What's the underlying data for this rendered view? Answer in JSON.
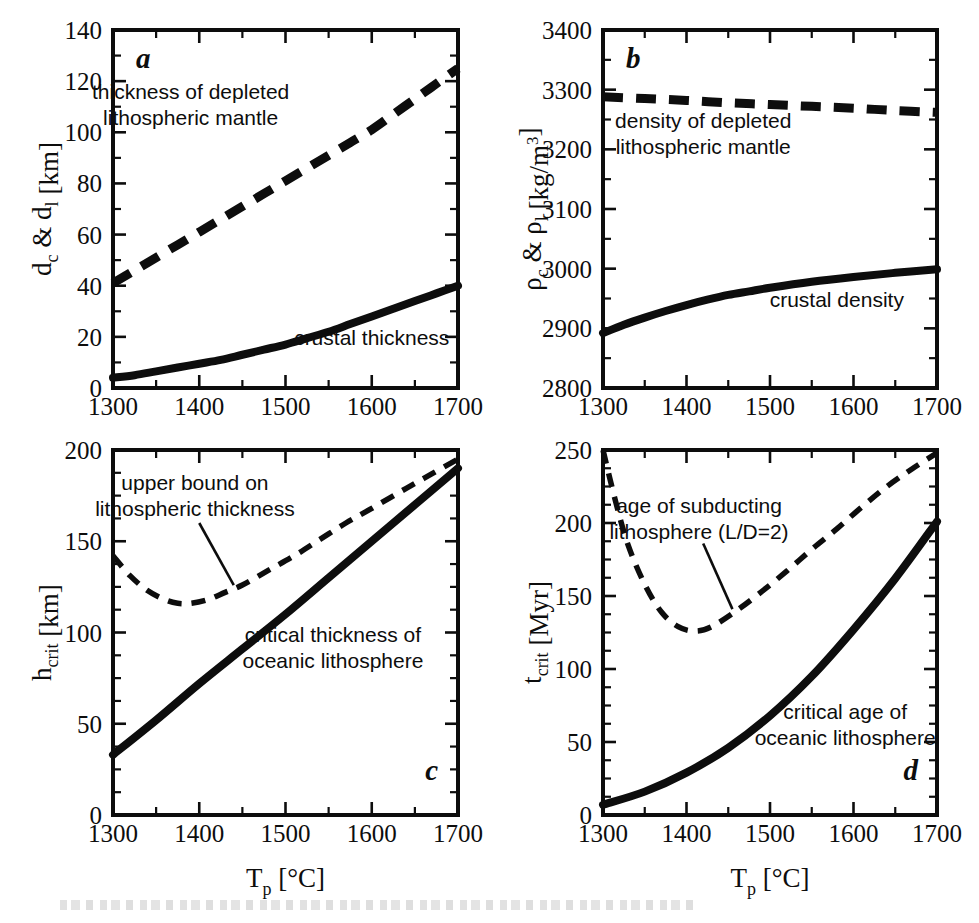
{
  "figure": {
    "title": "",
    "panels": [
      "a",
      "b",
      "c",
      "d"
    ],
    "shared_xlabel": "T_p [°C]",
    "xlabel_parts": {
      "base": "T",
      "sub": "p",
      "unit": "[°C]"
    }
  },
  "chart_data": [
    {
      "id": "panel-a",
      "type": "line",
      "panel_letter": "a",
      "title": "",
      "xlabel": "T_p [°C]",
      "ylabel": "d_c & d_l [km]",
      "ylabel_parts": {
        "p1": "d",
        "s1": "c",
        "amp": " & ",
        "p2": "d",
        "s2": "l",
        "unit": " [km]"
      },
      "xlim": [
        1300,
        1700
      ],
      "ylim": [
        0,
        140
      ],
      "xticks": [
        1300,
        1400,
        1500,
        1600,
        1700
      ],
      "yticks": [
        0,
        20,
        40,
        60,
        80,
        100,
        120,
        140
      ],
      "x_minor_step": 50,
      "y_minor_step": 10,
      "grid": false,
      "legend": "inline-annotations",
      "series": [
        {
          "name": "thickness of depleted lithospheric mantle",
          "style": "dashed-thick",
          "x": [
            1300,
            1325,
            1350,
            1375,
            1400,
            1425,
            1450,
            1475,
            1500,
            1525,
            1550,
            1575,
            1600,
            1625,
            1650,
            1675,
            1700
          ],
          "values": [
            41,
            46,
            51,
            56,
            61,
            66,
            71,
            76,
            81,
            86,
            91,
            96,
            101,
            107,
            113,
            119,
            125
          ]
        },
        {
          "name": "crustal thickness",
          "style": "solid-thick",
          "x": [
            1300,
            1325,
            1350,
            1375,
            1400,
            1425,
            1450,
            1475,
            1500,
            1525,
            1550,
            1575,
            1600,
            1625,
            1650,
            1675,
            1700
          ],
          "values": [
            4,
            5,
            6.5,
            8,
            9.5,
            11,
            13,
            15,
            17,
            19.5,
            22,
            25,
            28,
            31,
            34,
            37,
            40
          ]
        }
      ],
      "annotations": [
        {
          "text_lines": [
            "thickness of depleted",
            "lithospheric mantle"
          ],
          "x": 1390,
          "y": 113
        },
        {
          "text_lines": [
            "crustal thickness"
          ],
          "x": 1600,
          "y": 17
        }
      ]
    },
    {
      "id": "panel-b",
      "type": "line",
      "panel_letter": "b",
      "title": "",
      "xlabel": "T_p [°C]",
      "ylabel": "ρ_c & ρ_l [kg/m³]",
      "ylabel_parts": {
        "p1": "ρ",
        "s1": "c",
        "amp": " & ",
        "p2": "ρ",
        "s2": "l",
        "unit": " [kg/m",
        "sup": "3",
        "close": "]"
      },
      "xlim": [
        1300,
        1700
      ],
      "ylim": [
        2800,
        3400
      ],
      "xticks": [
        1300,
        1400,
        1500,
        1600,
        1700
      ],
      "yticks": [
        2800,
        2900,
        3000,
        3100,
        3200,
        3300,
        3400
      ],
      "x_minor_step": 50,
      "y_minor_step": 50,
      "grid": false,
      "legend": "inline-annotations",
      "series": [
        {
          "name": "density of depleted lithospheric mantle",
          "style": "dashed-thick",
          "x": [
            1300,
            1350,
            1400,
            1450,
            1500,
            1550,
            1600,
            1650,
            1700
          ],
          "values": [
            3288,
            3285,
            3282,
            3278,
            3275,
            3272,
            3269,
            3265,
            3262
          ]
        },
        {
          "name": "crustal density",
          "style": "solid-thick",
          "x": [
            1300,
            1325,
            1350,
            1375,
            1400,
            1425,
            1450,
            1475,
            1500,
            1550,
            1600,
            1650,
            1700
          ],
          "values": [
            2892,
            2906,
            2918,
            2929,
            2939,
            2948,
            2956,
            2962,
            2968,
            2978,
            2986,
            2993,
            2999
          ]
        }
      ],
      "annotations": [
        {
          "text_lines": [
            "density of depleted",
            "lithospheric mantle"
          ],
          "x": 1420,
          "y": 3235
        },
        {
          "text_lines": [
            "crustal density"
          ],
          "x": 1580,
          "y": 2935
        }
      ]
    },
    {
      "id": "panel-c",
      "type": "line",
      "panel_letter": "c",
      "title": "",
      "xlabel": "T_p [°C]",
      "ylabel": "h_crit [km]",
      "ylabel_parts": {
        "p1": "h",
        "s1": "crit",
        "unit": " [km]"
      },
      "xlim": [
        1300,
        1700
      ],
      "ylim": [
        0,
        200
      ],
      "xticks": [
        1300,
        1400,
        1500,
        1600,
        1700
      ],
      "yticks": [
        0,
        50,
        100,
        150,
        200
      ],
      "x_minor_step": 50,
      "y_minor_step": 12.5,
      "grid": false,
      "legend": "inline-annotations",
      "series": [
        {
          "name": "upper bound on lithospheric thickness",
          "style": "dashed-thin",
          "x": [
            1300,
            1320,
            1340,
            1360,
            1375,
            1390,
            1410,
            1430,
            1450,
            1480,
            1510,
            1540,
            1570,
            1600,
            1640,
            1670,
            1700
          ],
          "values": [
            142,
            131,
            123,
            118,
            116,
            116,
            118,
            122,
            126,
            134,
            142,
            151,
            160,
            168,
            179,
            187,
            195
          ]
        },
        {
          "name": "critical thickness of oceanic lithosphere",
          "style": "solid-thick",
          "x": [
            1300,
            1350,
            1400,
            1450,
            1500,
            1550,
            1600,
            1650,
            1700
          ],
          "values": [
            33,
            52,
            72,
            91,
            110,
            130,
            150,
            170,
            190
          ]
        }
      ],
      "annotations": [
        {
          "text_lines": [
            "upper bound on",
            "lithospheric thickness"
          ],
          "x": 1395,
          "y": 178
        },
        {
          "text_lines": [
            "critical thickness of",
            "oceanic lithosphere"
          ],
          "x": 1555,
          "y": 95
        }
      ],
      "leader_line": {
        "x1": 1400,
        "y1": 160,
        "x2": 1440,
        "y2": 126
      }
    },
    {
      "id": "panel-d",
      "type": "line",
      "panel_letter": "d",
      "title": "",
      "xlabel": "T_p [°C]",
      "ylabel": "t_crit [Myr]",
      "ylabel_parts": {
        "p1": "t",
        "s1": "crit",
        "unit": " [Myr]"
      },
      "xlim": [
        1300,
        1700
      ],
      "ylim": [
        0,
        250
      ],
      "xticks": [
        1300,
        1400,
        1500,
        1600,
        1700
      ],
      "yticks": [
        0,
        50,
        100,
        150,
        200,
        250
      ],
      "x_minor_step": 50,
      "y_minor_step": 12.5,
      "grid": false,
      "legend": "inline-annotations",
      "series": [
        {
          "name": "age of subducting lithosphere (L/D=2)",
          "style": "dashed-thin",
          "x": [
            1300,
            1315,
            1330,
            1350,
            1370,
            1390,
            1410,
            1430,
            1460,
            1490,
            1520,
            1550,
            1580,
            1610,
            1640,
            1670,
            1700
          ],
          "values": [
            250,
            215,
            185,
            158,
            139,
            129,
            126,
            129,
            140,
            153,
            167,
            182,
            196,
            211,
            225,
            237,
            248
          ]
        },
        {
          "name": "critical age of oceanic lithosphere",
          "style": "solid-thick",
          "x": [
            1300,
            1350,
            1400,
            1450,
            1500,
            1550,
            1600,
            1650,
            1700
          ],
          "values": [
            7,
            16,
            29,
            46,
            68,
            95,
            127,
            162,
            201
          ]
        }
      ],
      "annotations": [
        {
          "text_lines": [
            "age of subducting",
            "lithosphere (L/D=2)"
          ],
          "x": 1415,
          "y": 207
        },
        {
          "text_lines": [
            "critical age of",
            "oceanic lithosphere"
          ],
          "x": 1590,
          "y": 66
        }
      ],
      "leader_line": {
        "x1": 1420,
        "y1": 186,
        "x2": 1455,
        "y2": 141
      }
    }
  ]
}
